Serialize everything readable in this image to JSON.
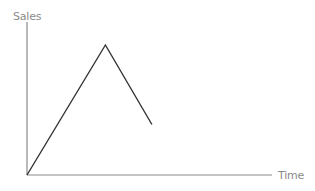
{
  "chart_data": {
    "type": "line",
    "title": "",
    "xlabel": "Time",
    "ylabel": "Sales",
    "grid": false,
    "legend": null,
    "tick_labels": {
      "x": [],
      "y": []
    },
    "xlim": [
      0,
      10
    ],
    "ylim": [
      0,
      10
    ],
    "series": [
      {
        "name": "Sales",
        "color": "#333333",
        "x": [
          0,
          3.2,
          5.1
        ],
        "y": [
          0,
          8.5,
          3.3
        ]
      }
    ]
  },
  "colors": {
    "axis": "#8a8a8a",
    "line": "#333333",
    "label": "#8a8a8a"
  }
}
